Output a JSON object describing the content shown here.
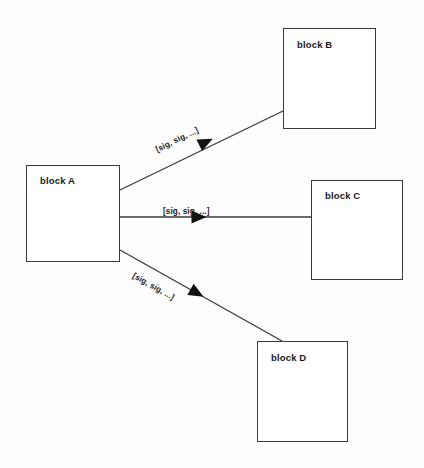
{
  "diagram": {
    "background_color": "#fdfdfd",
    "line_color": "#3a3a3a",
    "text_color": "#1b1b1b",
    "blocks": [
      {
        "id": "block-a",
        "label": "block A",
        "x": 26,
        "y": 165,
        "w": 94,
        "h": 97,
        "label_x": 40,
        "label_y": 175
      },
      {
        "id": "block-b",
        "label": "block B",
        "x": 283,
        "y": 28,
        "w": 93,
        "h": 101,
        "label_x": 297,
        "label_y": 39
      },
      {
        "id": "block-c",
        "label": "block C",
        "x": 311,
        "y": 180,
        "w": 92,
        "h": 100,
        "label_x": 325,
        "label_y": 190
      },
      {
        "id": "block-d",
        "label": "block D",
        "x": 257,
        "y": 341,
        "w": 91,
        "h": 101,
        "label_x": 271,
        "label_y": 352
      }
    ],
    "connections": [
      {
        "id": "a-to-b",
        "from": "block A",
        "to": "block B",
        "label": "[sig, sig, ...]",
        "x1": 120,
        "y1": 190,
        "x2": 283,
        "y2": 111,
        "arrow_x": 206,
        "arrow_y": 142,
        "arrow_angle": -25.9,
        "label_x": 158,
        "label_y": 145,
        "label_angle": -25.9
      },
      {
        "id": "a-to-c",
        "from": "block A",
        "to": "block C",
        "label": "[sig, sig, ...]",
        "x1": 120,
        "y1": 217,
        "x2": 311,
        "y2": 217,
        "arrow_x": 199,
        "arrow_y": 217,
        "arrow_angle": 0,
        "label_x": 163,
        "label_y": 207,
        "label_angle": 0
      },
      {
        "id": "a-to-d",
        "from": "block A",
        "to": "block D",
        "label": "[sig, sig, ...]",
        "x1": 120,
        "y1": 250,
        "x2": 282,
        "y2": 341,
        "arrow_x": 197,
        "arrow_y": 293,
        "arrow_angle": 29.3,
        "label_x": 131,
        "label_y": 270,
        "label_angle": 29.3
      }
    ]
  }
}
